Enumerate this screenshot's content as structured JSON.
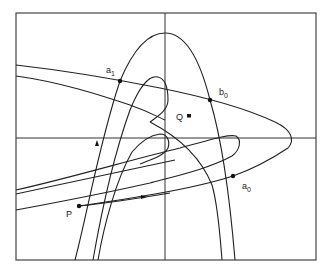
{
  "diagram": {
    "type": "phase-portrait homoclinic tangle",
    "points": [
      {
        "id": "a1",
        "label": "a",
        "sub": "1",
        "x": 120,
        "y": 81
      },
      {
        "id": "b0",
        "label": "b",
        "sub": "0",
        "x": 210,
        "y": 100
      },
      {
        "id": "Q",
        "label": "Q",
        "sub": "",
        "x": 189,
        "y": 116
      },
      {
        "id": "P",
        "label": "P",
        "sub": "",
        "x": 79,
        "y": 206
      },
      {
        "id": "a0",
        "label": "a",
        "sub": "0",
        "x": 233,
        "y": 176
      }
    ],
    "labels": {
      "a1": "a",
      "a1_sub": "1",
      "b0": "b",
      "b0_sub": "0",
      "Q": "Q",
      "P": "P",
      "a0": "a",
      "a0_sub": "0"
    },
    "colors": {
      "line": "#222222",
      "frame": "#444444",
      "background": "#ffffff"
    }
  }
}
